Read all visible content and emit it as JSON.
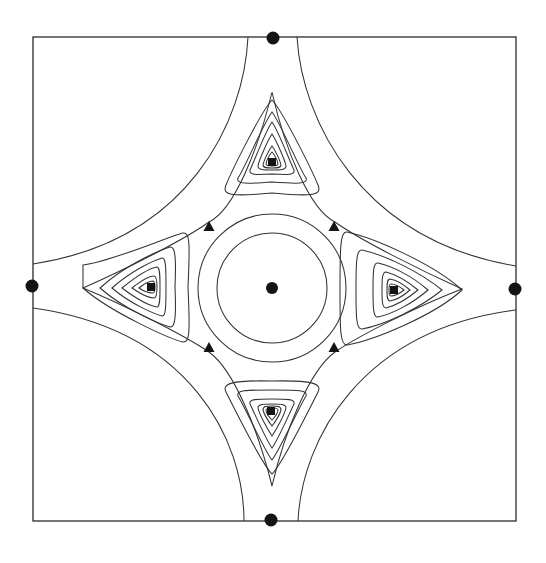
{
  "figure": {
    "type": "contour-map",
    "width": 546,
    "height": 563,
    "background": "#ffffff",
    "line_color": "#333333",
    "marker_color": "#141414"
  },
  "frame": {
    "x": 33,
    "y": 37,
    "width": 483,
    "height": 484
  },
  "center": {
    "x": 272,
    "y": 288
  },
  "markers": {
    "center_dot": {
      "x": 272,
      "y": 288,
      "r": 6
    },
    "edge_dots": [
      {
        "id": "top",
        "x": 273,
        "y": 38,
        "r": 6.5
      },
      {
        "id": "left",
        "x": 32,
        "y": 286,
        "r": 6.5
      },
      {
        "id": "right",
        "x": 515,
        "y": 289,
        "r": 6.5
      },
      {
        "id": "bottom",
        "x": 271,
        "y": 520,
        "r": 6.5
      }
    ],
    "squares": [
      {
        "id": "top",
        "x": 272,
        "y": 162,
        "size": 8
      },
      {
        "id": "left",
        "x": 151,
        "y": 287,
        "size": 8
      },
      {
        "id": "right",
        "x": 394,
        "y": 290,
        "size": 8
      },
      {
        "id": "bottom",
        "x": 271,
        "y": 411,
        "size": 8
      }
    ],
    "triangles": [
      {
        "id": "upper-left",
        "x": 209,
        "y": 226,
        "size": 11
      },
      {
        "id": "upper-right",
        "x": 334,
        "y": 226,
        "size": 11
      },
      {
        "id": "lower-left",
        "x": 209,
        "y": 347,
        "size": 11
      },
      {
        "id": "lower-right",
        "x": 334,
        "y": 347,
        "size": 11
      }
    ]
  },
  "contours": {
    "circles": [
      {
        "cx": 272,
        "cy": 288,
        "r": 55
      },
      {
        "cx": 272,
        "cy": 288,
        "r": 74
      }
    ],
    "outer_star": [
      "M 248 37 C 244 120 190 240 33 264",
      "M 297 37 C 302 120 360 240 516 266",
      "M 33 308 C 190 330 244 440 244 521",
      "M 516 310 C 360 330 302 440 298 521"
    ],
    "inner_star": "M 272 92 C 285 150 310 210 335 222 C 360 240 420 270 462 289 C 420 305 360 335 335 352 C 310 370 285 430 272 486 C 258 430 234 370 209 352 C 184 335 124 305 83 288 C 124 270 184 240 209 222 C 234 210 258 150 272 92 Z",
    "lobes": [
      {
        "id": "top",
        "loops": [
          "M 272 100 C 262 110 232 170 226 185 C 222 195 230 197 272 193 C 314 197 322 195 318 185 C 312 170 282 110 272 100 Z",
          "M 272 112 C 264 122 244 170 238 178 C 236 184 245 184 272 182 C 299 184 308 184 306 178 C 300 170 280 122 272 112 Z",
          "M 272 122 C 266 130 254 162 250 170 C 249 175 256 175 272 174 C 288 175 295 175 294 170 C 290 162 278 130 272 122 Z",
          "M 272 134 C 268 140 259 160 258 166 C 258 170 264 170 272 170 C 280 170 286 170 286 166 C 285 160 276 140 272 134 Z",
          "M 272 146 C 269 150 264 160 263 165 C 263 168 267 168 272 168 C 277 168 281 168 281 165 C 280 160 275 150 272 146 Z",
          "M 272 152 C 270 154 266 161 266 164 C 266 166 269 166 272 166 C 275 166 278 166 278 164 C 278 161 274 154 272 152 Z"
        ]
      },
      {
        "id": "left",
        "loops": [
          "M 83 265 C 110 262 170 236 183 233 C 190 232 190 245 188 287 C 190 330 190 343 183 342 C 170 339 110 312 83 288 Z",
          "M 100 288 C 125 265 160 250 170 247 C 176 246 176 262 175 287 C 176 312 176 328 170 327 C 160 324 125 310 100 288 Z",
          "M 112 288 C 132 270 155 260 162 258 C 166 257 166 270 166 287 C 166 304 166 317 162 316 C 155 314 132 305 112 288 Z",
          "M 122 288 C 138 275 151 268 157 267 C 160 267 160 276 160 287 C 160 298 160 307 157 307 C 151 306 138 300 122 288 Z",
          "M 132 288 C 142 280 150 276 154 276 C 156 276 157 281 157 287 C 157 293 156 298 154 298 C 150 298 142 295 132 288 Z",
          "M 139 288 C 145 283 150 281 153 281 C 155 282 155 284 155 287 C 155 290 155 293 153 293 C 150 293 145 292 139 288 Z"
        ]
      },
      {
        "id": "right",
        "loops": [
          "M 462 290 C 435 265 375 238 347 232 C 340 231 340 250 340 290 C 340 330 340 345 347 345 C 375 340 435 315 462 290 Z",
          "M 442 290 C 420 272 385 255 362 250 C 356 249 356 265 356 290 C 356 315 356 330 362 329 C 385 325 420 308 442 290 Z",
          "M 428 290 C 412 276 392 266 378 263 C 373 262 373 274 373 290 C 373 306 373 318 378 317 C 392 314 412 304 428 290 Z",
          "M 418 290 C 406 280 394 274 386 272 C 382 272 382 280 382 290 C 382 300 382 308 386 308 C 394 306 406 300 418 290 Z",
          "M 410 290 C 402 283 396 280 390 279 C 387 279 387 284 387 290 C 387 296 387 301 390 301 C 396 300 402 297 410 290 Z",
          "M 404 290 C 399 286 395 284 391 284 C 389 284 389 287 389 290 C 389 293 389 296 391 296 C 395 296 399 294 404 290 Z"
        ]
      },
      {
        "id": "bottom",
        "loops": [
          "M 272 474 C 262 464 232 404 226 392 C 222 384 230 380 272 381 C 314 380 322 384 318 392 C 312 404 282 464 272 474 Z",
          "M 272 460 C 264 450 244 405 238 396 C 236 390 245 390 272 390 C 299 390 308 390 306 396 C 300 405 280 450 272 460 Z",
          "M 272 448 C 266 440 254 412 250 404 C 249 399 256 399 272 399 C 288 399 295 399 294 404 C 290 412 278 440 272 448 Z",
          "M 272 436 C 268 430 259 414 258 408 C 258 404 264 404 272 404 C 280 404 286 404 286 408 C 285 414 276 430 272 436 Z",
          "M 272 426 C 269 422 264 414 263 410 C 263 406 267 406 272 406 C 277 406 281 406 281 410 C 280 414 275 422 272 426 Z",
          "M 272 420 C 270 418 266 413 266 410 C 266 408 269 408 272 408 C 275 408 278 408 278 410 C 278 413 274 418 272 420 Z"
        ]
      }
    ]
  }
}
